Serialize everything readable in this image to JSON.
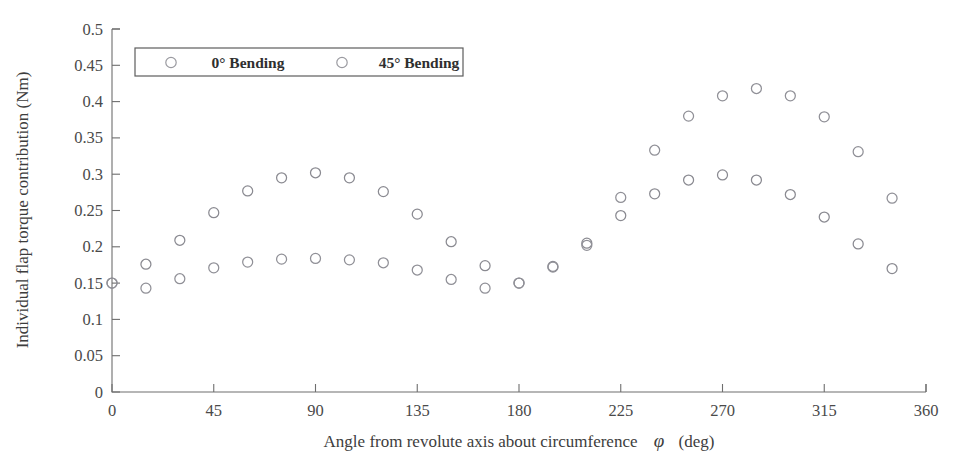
{
  "chart_data": {
    "type": "scatter",
    "title": "",
    "xlabel": "Angle from revolute axis about circumference  φ  (deg)",
    "ylabel": "Individual flap torque contribution (Nm)",
    "xlim": [
      0,
      360
    ],
    "ylim": [
      0,
      0.5
    ],
    "xticks": [
      0,
      45,
      90,
      135,
      180,
      225,
      270,
      315,
      360
    ],
    "xticklabels": [
      "0",
      "45",
      "90",
      "135",
      "180",
      "225",
      "270",
      "315",
      "360"
    ],
    "yticks": [
      0,
      0.05,
      0.1,
      0.15,
      0.2,
      0.25,
      0.3,
      0.35,
      0.4,
      0.45,
      0.5
    ],
    "yticklabels": [
      "0",
      "0.05",
      "0.1",
      "0.15",
      "0.2",
      "0.25",
      "0.3",
      "0.35",
      "0.4",
      "0.45",
      "0.5"
    ],
    "grid": false,
    "legend_position": "upper-left-inside",
    "marker": "open-circle",
    "series": [
      {
        "name": "0° Bending",
        "marker": "open-circle",
        "color": "#8a8a91",
        "x": [
          0,
          15,
          30,
          45,
          60,
          75,
          90,
          105,
          120,
          135,
          150,
          165,
          180,
          195,
          210,
          225,
          240,
          255,
          270,
          285,
          300,
          315,
          330,
          345
        ],
        "y": [
          0.15,
          0.176,
          0.209,
          0.247,
          0.277,
          0.295,
          0.302,
          0.295,
          0.276,
          0.245,
          0.207,
          0.174,
          0.15,
          0.173,
          0.205,
          0.243,
          0.273,
          0.292,
          0.299,
          0.292,
          0.272,
          0.241,
          0.204,
          0.17
        ]
      },
      {
        "name": "45° Bending",
        "marker": "open-circle",
        "color": "#909097",
        "x": [
          0,
          15,
          30,
          45,
          60,
          75,
          90,
          105,
          120,
          135,
          150,
          165,
          180,
          195,
          210,
          225,
          240,
          255,
          270,
          285,
          300,
          315,
          330,
          345
        ],
        "y": [
          0.15,
          0.143,
          0.156,
          0.171,
          0.179,
          0.183,
          0.184,
          0.182,
          0.178,
          0.168,
          0.155,
          0.143,
          0.15,
          0.172,
          0.202,
          0.268,
          0.333,
          0.38,
          0.408,
          0.418,
          0.408,
          0.379,
          0.331,
          0.267
        ]
      }
    ]
  },
  "legend": {
    "entries": [
      {
        "label": "0° Bending",
        "marker": "open-circle"
      },
      {
        "label": "45° Bending",
        "marker": "open-circle"
      }
    ]
  },
  "axes": {
    "x_title": "Angle from revolute axis about circumference",
    "x_symbol": "φ",
    "x_unit": "(deg)",
    "y_title": "Individual flap torque contribution (Nm)"
  },
  "colors": {
    "marker_stroke": "#8d8d94",
    "axis": "#6e6e6e",
    "text": "#3a3a3a",
    "background": "#ffffff"
  }
}
